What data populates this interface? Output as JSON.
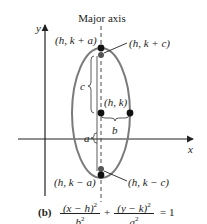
{
  "figure": {
    "label": "(b)",
    "title": "Major axis",
    "axes": {
      "x_label": "x",
      "y_label": "y"
    },
    "points": {
      "top_vertex": "(h, k + a)",
      "top_focus": "(h, k + c)",
      "center": "(h, k)",
      "bottom_vertex": "(h, k − a)",
      "bottom_focus": "(h, k − c)"
    },
    "brace_labels": {
      "c": "c",
      "b": "b",
      "a": "a"
    },
    "equation": {
      "term1_num": "(x − h)",
      "term1_den": "b",
      "plus": "+",
      "term2_num": "(y − k)",
      "term2_den": "a",
      "exponent": "2",
      "rhs": "= 1"
    },
    "colors": {
      "ellipse": "#7a7a7a",
      "axes": "#222222",
      "points": "#111111",
      "focus": "#555555"
    }
  }
}
